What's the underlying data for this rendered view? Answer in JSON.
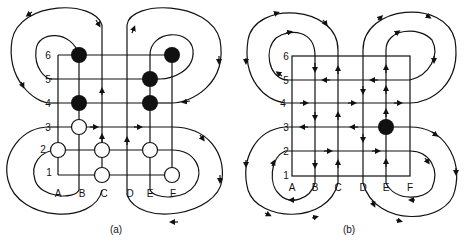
{
  "figure": {
    "panels": [
      {
        "id": "a",
        "caption": "(a)",
        "row_labels": [
          "6",
          "5",
          "4",
          "3",
          "2",
          "1"
        ],
        "column_labels": [
          "A",
          "B",
          "C",
          "D",
          "E",
          "F"
        ],
        "filled_nodes": [
          "B6",
          "F6",
          "E5",
          "B4",
          "E4"
        ],
        "open_nodes": [
          "B3",
          "A2",
          "C2",
          "E2",
          "C1",
          "F1"
        ]
      },
      {
        "id": "b",
        "caption": "(b)",
        "row_labels": [
          "6",
          "5",
          "4",
          "3",
          "2",
          "1"
        ],
        "column_labels": [
          "A",
          "B",
          "C",
          "D",
          "E",
          "F"
        ],
        "filled_nodes": [
          "E3"
        ],
        "open_nodes": []
      }
    ]
  }
}
